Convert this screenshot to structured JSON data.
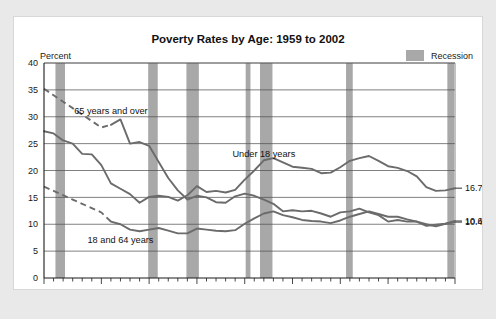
{
  "chart_data": {
    "type": "line",
    "title": "Poverty Rates by Age: 1959 to 2002",
    "xlabel": "",
    "ylabel": "Percent",
    "ylim": [
      0,
      40
    ],
    "xlim": [
      1959,
      2002
    ],
    "yticks": [
      0,
      5,
      10,
      15,
      20,
      25,
      30,
      35,
      40
    ],
    "xticks": [
      1959,
      1965,
      1970,
      1975,
      1980,
      1985,
      1990,
      1995,
      2002
    ],
    "grid": true,
    "legend_position": "top-right",
    "legend": [
      {
        "label": "Recession",
        "color": "#a8a8a8",
        "type": "band"
      }
    ],
    "annotations": [
      {
        "text": "65 years and over",
        "x": 1966.0,
        "y": 30.5
      },
      {
        "text": "Under 18 years",
        "x": 1982.0,
        "y": 22.6
      },
      {
        "text": "18 and 64 years",
        "x": 1967.0,
        "y": 6.6
      }
    ],
    "end_labels": [
      {
        "text": "16.7%",
        "series": "Under 18 years",
        "value": 16.7
      },
      {
        "text": "10.6%",
        "series": "18 and 64 years",
        "value": 10.6
      },
      {
        "text": "10.4%",
        "series": "65 years and over",
        "value": 10.4
      }
    ],
    "x": [
      1959,
      1960,
      1961,
      1962,
      1963,
      1964,
      1965,
      1966,
      1967,
      1968,
      1969,
      1970,
      1971,
      1972,
      1973,
      1974,
      1975,
      1976,
      1977,
      1978,
      1979,
      1980,
      1981,
      1982,
      1983,
      1984,
      1985,
      1986,
      1987,
      1988,
      1989,
      1990,
      1991,
      1992,
      1993,
      1994,
      1995,
      1996,
      1997,
      1998,
      1999,
      2000,
      2001,
      2002
    ],
    "series": [
      {
        "name": "65 years and over",
        "dashed_until": 1966,
        "values": [
          35.2,
          34.0,
          32.8,
          31.6,
          30.4,
          29.2,
          28.0,
          28.5,
          29.5,
          25.0,
          25.3,
          24.6,
          21.6,
          18.6,
          16.3,
          14.6,
          15.3,
          15.0,
          14.1,
          14.0,
          15.2,
          15.7,
          15.3,
          14.6,
          13.8,
          12.4,
          12.6,
          12.4,
          12.5,
          12.0,
          11.4,
          12.2,
          12.4,
          12.9,
          12.2,
          11.7,
          10.5,
          10.8,
          10.5,
          10.5,
          9.7,
          9.9,
          10.1,
          10.4
        ]
      },
      {
        "name": "Under 18 years",
        "values": [
          27.3,
          26.9,
          25.6,
          25.0,
          23.1,
          23.0,
          21.0,
          17.6,
          16.6,
          15.6,
          14.0,
          15.1,
          15.3,
          15.1,
          14.4,
          15.4,
          17.1,
          16.0,
          16.2,
          15.9,
          16.4,
          18.3,
          20.0,
          21.9,
          22.3,
          21.5,
          20.7,
          20.5,
          20.3,
          19.5,
          19.6,
          20.6,
          21.8,
          22.3,
          22.7,
          21.8,
          20.8,
          20.5,
          19.9,
          18.9,
          16.9,
          16.2,
          16.3,
          16.7
        ]
      },
      {
        "name": "18 and 64 years",
        "dashed_until": 1966,
        "values": [
          17.0,
          16.2,
          15.4,
          14.6,
          13.8,
          13.0,
          12.2,
          10.5,
          10.0,
          9.0,
          8.7,
          9.0,
          9.3,
          8.8,
          8.3,
          8.3,
          9.2,
          9.0,
          8.8,
          8.7,
          8.9,
          10.1,
          11.1,
          12.0,
          12.4,
          11.7,
          11.3,
          10.8,
          10.6,
          10.5,
          10.2,
          10.7,
          11.4,
          11.9,
          12.4,
          11.9,
          11.4,
          11.4,
          10.9,
          10.5,
          10.0,
          9.6,
          10.1,
          10.6
        ]
      }
    ],
    "recessions": [
      {
        "start": 1960.2,
        "end": 1961.2
      },
      {
        "start": 1969.9,
        "end": 1970.9
      },
      {
        "start": 1973.9,
        "end": 1975.2
      },
      {
        "start": 1980.1,
        "end": 1980.6
      },
      {
        "start": 1981.6,
        "end": 1982.9
      },
      {
        "start": 1990.6,
        "end": 1991.3
      },
      {
        "start": 2001.2,
        "end": 2001.9
      }
    ]
  }
}
